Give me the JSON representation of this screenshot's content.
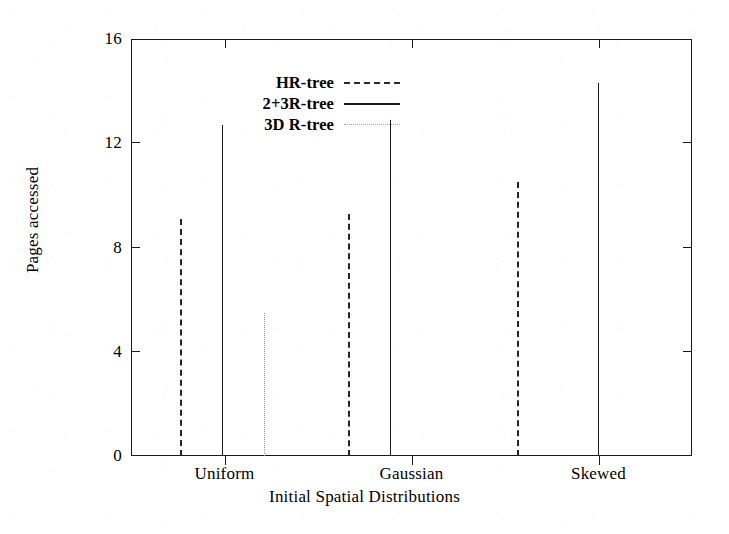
{
  "chart_data": {
    "type": "bar",
    "title": "",
    "subtitle": "",
    "xlabel": "Initial Spatial Distributions",
    "ylabel": "Pages accessed",
    "categories": [
      "Uniform",
      "Gaussian",
      "Skewed"
    ],
    "series": [
      {
        "name": "HR-tree",
        "linestyle": "dash-dot",
        "color": "#242424",
        "values": [
          9.1,
          9.3,
          10.5
        ]
      },
      {
        "name": "2+3R-tree",
        "linestyle": "solid",
        "color": "#1b1b1b",
        "values": [
          12.7,
          12.9,
          14.3
        ]
      },
      {
        "name": "3D R-tree",
        "linestyle": "dotted",
        "color": "#8e8e8e",
        "values": [
          5.5,
          null,
          null
        ]
      }
    ],
    "ylim": [
      0,
      16
    ],
    "yticks": [
      0,
      4,
      8,
      12,
      16
    ],
    "ytick_labels": [
      "0",
      "4",
      "8",
      "12",
      "16"
    ],
    "xlim": [
      0,
      9
    ],
    "grid": false,
    "legend_position": "upper-left-inside",
    "style_note": "impulse / vertical-line bars, no fill"
  },
  "axes": {
    "y_title": "Pages accessed",
    "x_title": "Initial Spatial Distributions",
    "y_ticks": [
      {
        "label": "16",
        "value": 16
      },
      {
        "label": "12",
        "value": 12
      },
      {
        "label": "8",
        "value": 8
      },
      {
        "label": "4",
        "value": 4
      },
      {
        "label": "0",
        "value": 0
      }
    ],
    "x_ticks": [
      {
        "label": "Uniform",
        "value": 1.5
      },
      {
        "label": "Gaussian",
        "value": 4.5
      },
      {
        "label": "Skewed",
        "value": 7.5
      }
    ]
  },
  "legend": {
    "entries": [
      {
        "label": "HR-tree",
        "style": "dashdot"
      },
      {
        "label": "2+3R-tree",
        "style": "solid"
      },
      {
        "label": "3D R-tree",
        "style": "dotted"
      }
    ]
  },
  "bars": [
    {
      "group": "Uniform",
      "series": "HR-tree",
      "style": "dashdot",
      "value": 9.1,
      "x_frac": 0.0875
    },
    {
      "group": "Uniform",
      "series": "2+3R-tree",
      "style": "solid",
      "value": 12.7,
      "x_frac": 0.1625
    },
    {
      "group": "Uniform",
      "series": "3D R-tree",
      "style": "dotted",
      "value": 5.5,
      "x_frac": 0.2375
    },
    {
      "group": "Gaussian",
      "series": "HR-tree",
      "style": "dashdot",
      "value": 9.3,
      "x_frac": 0.3875
    },
    {
      "group": "Gaussian",
      "series": "2+3R-tree",
      "style": "solid",
      "value": 12.9,
      "x_frac": 0.4625
    },
    {
      "group": "Skewed",
      "series": "HR-tree",
      "style": "dashdot",
      "value": 10.5,
      "x_frac": 0.6875
    },
    {
      "group": "Skewed",
      "series": "2+3R-tree",
      "style": "solid",
      "value": 14.3,
      "x_frac": 0.8325
    }
  ],
  "colors": {
    "axis": "#1a1a1a",
    "solid_series": "#1b1b1b",
    "dashdot_series": "#242424",
    "dotted_series": "#8e8e8e",
    "background": "#ffffff"
  }
}
